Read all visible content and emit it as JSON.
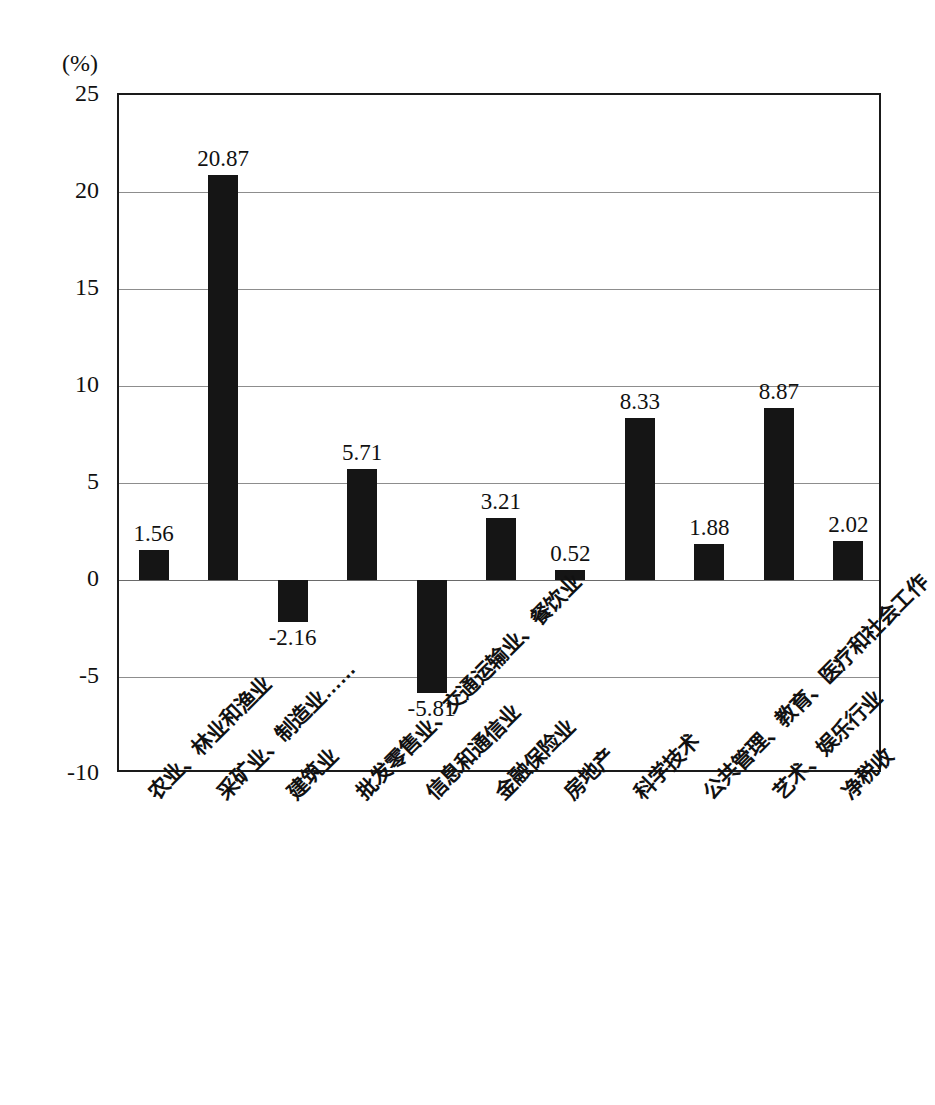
{
  "chart_data": {
    "type": "bar",
    "title": "",
    "subtitle": "",
    "unit_label": "(%)",
    "xlabel": "",
    "ylabel": "",
    "ylim": [
      -10,
      25
    ],
    "ytick_values": [
      -10,
      -5,
      0,
      5,
      10,
      15,
      20,
      25
    ],
    "ytick_labels": [
      "-10",
      "-5",
      "0",
      "5",
      "10",
      "15",
      "20",
      "25"
    ],
    "grid": true,
    "grid_axis": "y",
    "legend": false,
    "legend_position": "none",
    "bar_color": "#151515",
    "categories": [
      "农业、林业和渔业",
      "采矿业、制造业……",
      "建筑业",
      "批发零售业、交通运输业、餐饮业",
      "信息和通信业",
      "金融保险业",
      "房地产",
      "科学技术",
      "公共管理、教育、医疗和社会工作",
      "艺术、娱乐行业",
      "净税收"
    ],
    "values": [
      1.56,
      20.87,
      -2.16,
      5.71,
      -5.81,
      3.21,
      0.52,
      8.33,
      1.88,
      8.87,
      2.02
    ],
    "value_labels": [
      "1.56",
      "20.87",
      "-2.16",
      "5.71",
      "-5.81",
      "3.21",
      "0.52",
      "8.33",
      "1.88",
      "8.87",
      "2.02"
    ]
  }
}
